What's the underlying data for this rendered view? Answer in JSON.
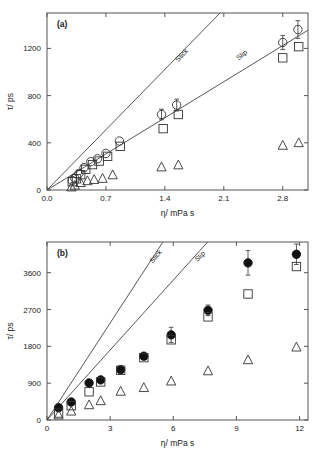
{
  "figure": {
    "panel_a_tag": "(a)",
    "panel_b_tag": "(b)",
    "xlabel": "η/ mPa s",
    "ylabel": "τ/ ps"
  },
  "chart_data": [
    {
      "type": "scatter",
      "panel": "(a)",
      "title": "",
      "xlabel": "η/ mPa s",
      "ylabel": "τ/ ps",
      "xlim": [
        0,
        3.1
      ],
      "ylim": [
        0,
        1500
      ],
      "xticks": [
        0.0,
        0.7,
        1.4,
        2.1,
        2.8
      ],
      "xticklabels": [
        "0.0",
        "0.7",
        "1.4",
        "2.1",
        "2.8"
      ],
      "yticks": [
        0,
        400,
        800,
        1200
      ],
      "yticklabels": [
        "0",
        "400",
        "800",
        "1200"
      ],
      "grid": false,
      "legend": "none",
      "annotations": [
        {
          "text": "Stick",
          "x": 1.62,
          "y": 1130,
          "rotation": -47
        },
        {
          "text": "Slip",
          "x": 2.33,
          "y": 1130,
          "rotation": -40
        }
      ],
      "reference_lines": [
        {
          "name": "Stick",
          "slope": 730,
          "intercept": 0,
          "x_from": 0.0,
          "x_to": 2.06
        },
        {
          "name": "Slip",
          "slope": 437,
          "intercept": 0,
          "x_from": 0.0,
          "x_to": 3.1
        }
      ],
      "series": [
        {
          "name": "open-circle",
          "marker": "circle-open",
          "x": [
            0.3,
            0.33,
            0.38,
            0.44,
            0.52,
            0.6,
            0.7,
            0.86,
            1.36,
            1.54,
            2.8,
            2.98
          ],
          "y": [
            80,
            100,
            140,
            190,
            240,
            265,
            310,
            415,
            640,
            720,
            1250,
            1360
          ],
          "yerr": [
            0,
            0,
            0,
            0,
            0,
            0,
            0,
            0,
            45,
            50,
            60,
            75
          ]
        },
        {
          "name": "open-square",
          "marker": "square-open",
          "x": [
            0.3,
            0.35,
            0.4,
            0.46,
            0.54,
            0.62,
            0.72,
            0.87,
            1.38,
            1.56,
            2.8,
            2.99
          ],
          "y": [
            70,
            95,
            130,
            175,
            215,
            245,
            285,
            370,
            520,
            640,
            1120,
            1215
          ],
          "yerr": [
            0,
            0,
            0,
            0,
            0,
            0,
            0,
            0,
            0,
            0,
            0,
            0
          ]
        },
        {
          "name": "open-triangle",
          "marker": "triangle-open",
          "x": [
            0.29,
            0.33,
            0.4,
            0.48,
            0.56,
            0.66,
            0.78,
            1.36,
            1.56,
            2.8,
            2.99
          ],
          "y": [
            25,
            40,
            62,
            78,
            88,
            98,
            128,
            195,
            212,
            378,
            400
          ],
          "yerr": [
            0,
            0,
            0,
            0,
            0,
            0,
            0,
            0,
            0,
            0,
            0
          ]
        }
      ]
    },
    {
      "type": "scatter",
      "panel": "(b)",
      "title": "",
      "xlabel": "η/ mPa s",
      "ylabel": "τ/ ps",
      "xlim": [
        0,
        12.4
      ],
      "ylim": [
        0,
        4350
      ],
      "xticks": [
        0,
        3,
        6,
        9,
        12
      ],
      "xticklabels": [
        "0",
        "3",
        "6",
        "9",
        "12"
      ],
      "yticks": [
        0,
        900,
        1800,
        2700,
        3600
      ],
      "yticklabels": [
        "0",
        "900",
        "1800",
        "2700",
        "3600"
      ],
      "grid": false,
      "legend": "none",
      "annotations": [
        {
          "text": "Stick",
          "x": 5.25,
          "y": 3960,
          "rotation": -51
        },
        {
          "text": "Slip",
          "x": 7.35,
          "y": 3960,
          "rotation": -45
        }
      ],
      "reference_lines": [
        {
          "name": "Stick",
          "slope": 790,
          "intercept": 0,
          "x_from": 0.0,
          "x_to": 5.6
        },
        {
          "name": "Slip",
          "slope": 570,
          "intercept": 0,
          "x_from": 0.0,
          "x_to": 7.7
        }
      ],
      "series": [
        {
          "name": "filled-circle",
          "marker": "circle-filled",
          "x": [
            0.55,
            1.15,
            2.0,
            2.55,
            3.5,
            4.6,
            5.9,
            7.65,
            9.55,
            11.85
          ],
          "y": [
            300,
            440,
            905,
            980,
            1230,
            1560,
            2080,
            2680,
            3840,
            4050
          ],
          "yerr": [
            0,
            0,
            0,
            0,
            40,
            55,
            185,
            130,
            300,
            250
          ]
        },
        {
          "name": "open-square",
          "marker": "square-open",
          "x": [
            0.55,
            1.15,
            2.0,
            2.55,
            3.5,
            4.6,
            5.9,
            7.65,
            9.55,
            11.85
          ],
          "y": [
            170,
            350,
            690,
            930,
            1215,
            1525,
            1960,
            2520,
            3080,
            3750
          ],
          "yerr": [
            0,
            0,
            0,
            0,
            0,
            0,
            0,
            0,
            0,
            0
          ]
        },
        {
          "name": "open-triangle",
          "marker": "triangle-open",
          "x": [
            0.55,
            1.15,
            2.0,
            2.55,
            3.5,
            4.6,
            5.9,
            7.65,
            9.55,
            11.85
          ],
          "y": [
            120,
            215,
            370,
            470,
            700,
            790,
            950,
            1200,
            1470,
            1780
          ],
          "yerr": [
            0,
            0,
            0,
            0,
            0,
            0,
            0,
            0,
            0,
            0
          ]
        }
      ]
    }
  ]
}
